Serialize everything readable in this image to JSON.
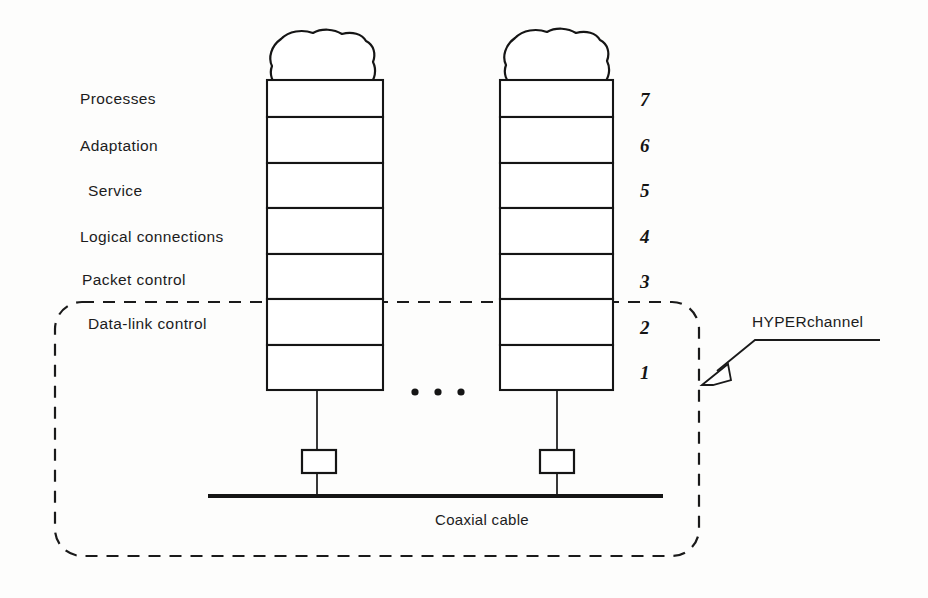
{
  "figure": {
    "background_color": "#fdfdfc",
    "ink_color": "#151515"
  },
  "layers": [
    {
      "number": "7",
      "label": "Processes"
    },
    {
      "number": "6",
      "label": "Adaptation"
    },
    {
      "number": "5",
      "label": "Service"
    },
    {
      "number": "4",
      "label": "Logical connections"
    },
    {
      "number": "3",
      "label": "Packet control"
    },
    {
      "number": "2",
      "label": "Data-link control"
    },
    {
      "number": "1",
      "label": ""
    }
  ],
  "annotations": {
    "boundary_callout": "HYPERchannel",
    "bus_label": "Coaxial cable",
    "ellipsis": "• • •"
  },
  "nodes": [
    {
      "name": "host-stack-left"
    },
    {
      "name": "host-stack-right"
    }
  ]
}
